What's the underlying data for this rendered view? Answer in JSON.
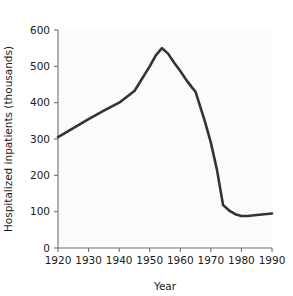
{
  "chart_data": {
    "type": "line",
    "title": "",
    "subtitle": "",
    "xlabel": "Year",
    "ylabel": "Hospitalized inpatients (thousands)",
    "xlim": [
      1920,
      1990
    ],
    "ylim": [
      0,
      600
    ],
    "xticks": [
      1920,
      1930,
      1940,
      1950,
      1960,
      1970,
      1980,
      1990
    ],
    "yticks": [
      0,
      100,
      200,
      300,
      400,
      500,
      600
    ],
    "xtick_labels": [
      "1920",
      "1930",
      "1940",
      "1950",
      "1960",
      "1970",
      "1980",
      "1990"
    ],
    "ytick_labels": [
      "0",
      "100",
      "200",
      "300",
      "400",
      "500",
      "600"
    ],
    "grid": false,
    "legend": false,
    "legend_position": "none",
    "line_color": "#333333",
    "background_color": "#fbfbfb",
    "axis_color": "#6e6e6e",
    "series": [
      {
        "name": "Hospitalized inpatients",
        "x": [
          1920,
          1925,
          1930,
          1935,
          1940,
          1945,
          1950,
          1952,
          1954,
          1956,
          1958,
          1960,
          1962,
          1964,
          1965,
          1968,
          1970,
          1972,
          1974,
          1976,
          1978,
          1980,
          1982,
          1985,
          1990
        ],
        "values": [
          305,
          330,
          355,
          378,
          400,
          432,
          500,
          530,
          550,
          535,
          510,
          487,
          462,
          440,
          430,
          350,
          290,
          215,
          118,
          103,
          93,
          88,
          88,
          91,
          95
        ]
      }
    ],
    "annotations": []
  },
  "figure": {
    "name": "hospitalized-inpatients-line-chart",
    "axis_titles": {
      "x": "Year",
      "y": "Hospitalized inpatients (thousands)"
    }
  }
}
